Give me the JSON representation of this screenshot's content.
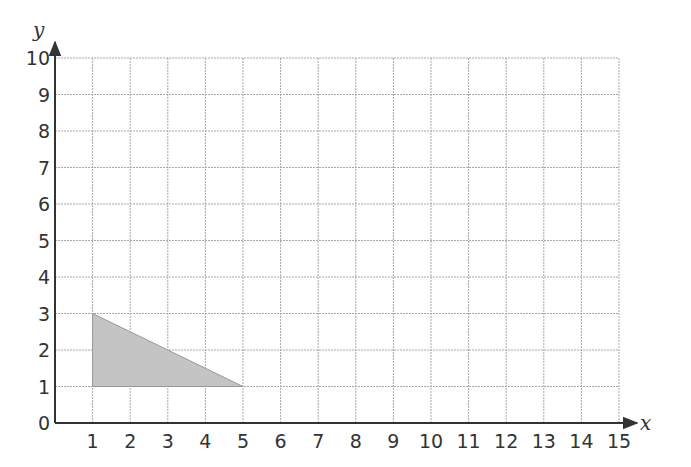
{
  "chart_data": {
    "type": "scatter",
    "title": "",
    "xlabel": "x",
    "ylabel": "y",
    "xlim": [
      0,
      15
    ],
    "ylim": [
      0,
      10
    ],
    "grid": true,
    "x_ticks": [
      "1",
      "2",
      "3",
      "4",
      "5",
      "6",
      "7",
      "8",
      "9",
      "10",
      "11",
      "12",
      "13",
      "14",
      "15"
    ],
    "y_ticks": [
      "0",
      "1",
      "2",
      "3",
      "4",
      "5",
      "6",
      "7",
      "8",
      "9",
      "10"
    ],
    "shapes": [
      {
        "name": "shaded-triangle",
        "kind": "polygon",
        "vertices": [
          [
            1,
            1
          ],
          [
            1,
            3
          ],
          [
            5,
            1
          ]
        ],
        "fill": "#c4c4c4",
        "stroke": "#999999"
      }
    ]
  },
  "colors": {
    "grid": "#a8a8a8",
    "axis": "#333333",
    "shape_fill": "#c4c4c4"
  }
}
